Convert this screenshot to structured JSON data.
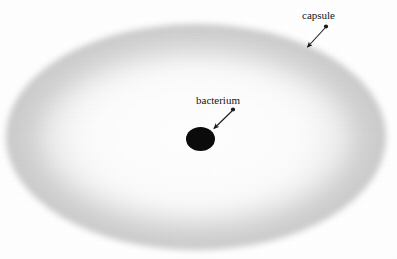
{
  "figure": {
    "type": "biology-diagram",
    "background_color": "#ffffff"
  },
  "labels": {
    "capsule": "capsule",
    "bacterium": "bacterium"
  },
  "structures": {
    "capsule": {
      "name": "capsule",
      "shape": "ellipse",
      "fill": "#b4b4b4",
      "core_fill": "#fdfdfd"
    },
    "bacterium": {
      "name": "bacterium",
      "shape": "ellipse",
      "fill": "#0b0b0b"
    }
  },
  "annotations": [
    {
      "label": "capsule",
      "arrow_from": "326,27",
      "arrow_to": "305,49",
      "color": "#1a1a1a"
    },
    {
      "label": "bacterium",
      "arrow_from": "233,110",
      "arrow_to": "212,130",
      "color": "#1a1a1a"
    }
  ]
}
